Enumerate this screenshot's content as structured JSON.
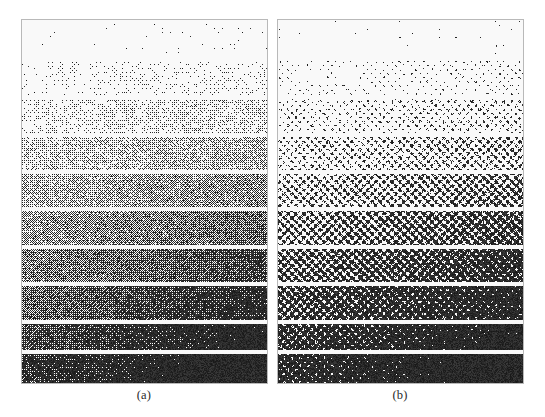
{
  "figure": {
    "background_color": "#ffffff",
    "width": 545,
    "height": 417
  },
  "panels": [
    {
      "id": "a",
      "caption": "(a)",
      "x": 21,
      "y": 19,
      "width": 247,
      "height": 365,
      "border_color": "#b9b9b9",
      "method": "dispersed-dot dither",
      "band_count": 10,
      "gap_color": "#ffffff"
    },
    {
      "id": "b",
      "caption": "(b)",
      "x": 277,
      "y": 19,
      "width": 247,
      "height": 365,
      "border_color": "#b9b9b9",
      "method": "clustered-dot dither",
      "band_count": 10,
      "gap_color": "#ffffff"
    }
  ],
  "chart_data": {
    "type": "heatmap",
    "xlabel": "",
    "ylabel": "",
    "grid": false,
    "legend": "none",
    "categories": [
      "band 1",
      "band 2",
      "band 3",
      "band 4",
      "band 5",
      "band 6",
      "band 7",
      "band 8",
      "band 9",
      "band 10"
    ],
    "series": [
      {
        "name": "(a)",
        "values": [
          0.04,
          0.14,
          0.24,
          0.35,
          0.45,
          0.56,
          0.66,
          0.76,
          0.86,
          0.95
        ]
      },
      {
        "name": "(b)",
        "values": [
          0.04,
          0.14,
          0.24,
          0.35,
          0.45,
          0.56,
          0.66,
          0.76,
          0.86,
          0.95
        ]
      }
    ],
    "band_geometry": [
      {
        "index": 1,
        "top": 1,
        "height": 35
      },
      {
        "index": 2,
        "top": 41,
        "height": 34
      },
      {
        "index": 3,
        "top": 79,
        "height": 34
      },
      {
        "index": 4,
        "top": 117,
        "height": 33
      },
      {
        "index": 5,
        "top": 154,
        "height": 33
      },
      {
        "index": 6,
        "top": 191,
        "height": 34
      },
      {
        "index": 7,
        "top": 229,
        "height": 33
      },
      {
        "index": 8,
        "top": 266,
        "height": 34
      },
      {
        "index": 9,
        "top": 304,
        "height": 26
      },
      {
        "index": 10,
        "top": 334,
        "height": 29
      }
    ],
    "gap_height": 4,
    "ylim": [
      0,
      1
    ]
  },
  "captions": {
    "a": "(a)",
    "b": "(b)"
  }
}
